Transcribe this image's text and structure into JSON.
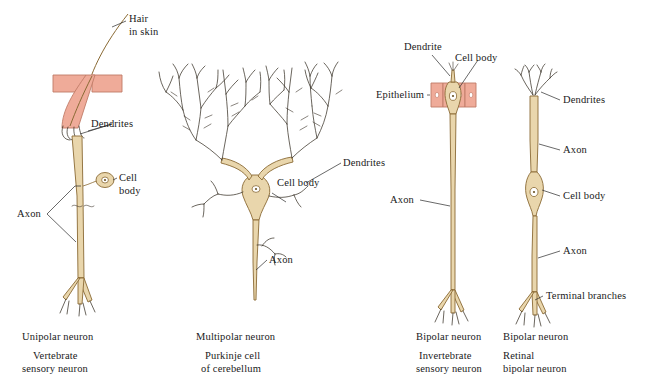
{
  "figure": {
    "background_color": "#ffffff",
    "ink_color": "#1a1a1a",
    "neuron_fill": "#e9d6ac",
    "neuron_outline": "#8a6a34",
    "skin_fill": "#efab99",
    "skin_outline": "#c07a67",
    "dendrite_line": "#3a3328"
  },
  "panels": [
    {
      "id": "unipolar",
      "name": "Vertebrate sensory neuron",
      "labels": [
        {
          "id": "hair-in-skin",
          "text": "Hair\nin skin"
        },
        {
          "id": "dendrites",
          "text": "Dendrites"
        },
        {
          "id": "cell-body",
          "text": "Cell\nbody"
        },
        {
          "id": "axon",
          "text": "Axon"
        }
      ],
      "caption_type": "Unipolar neuron",
      "caption_example_line1": "Vertebrate",
      "caption_example_line2": "sensory neuron"
    },
    {
      "id": "multipolar",
      "name": "Purkinje cell of cerebellum",
      "labels": [
        {
          "id": "dendrites",
          "text": "Dendrites"
        },
        {
          "id": "cell-body",
          "text": "Cell body"
        },
        {
          "id": "axon",
          "text": "Axon"
        }
      ],
      "caption_type": "Multipolar neuron",
      "caption_example_line1": "Purkinje cell",
      "caption_example_line2": "of cerebellum"
    },
    {
      "id": "bipolar-invertebrate",
      "name": "Invertebrate sensory neuron",
      "labels": [
        {
          "id": "dendrite",
          "text": "Dendrite"
        },
        {
          "id": "cell-body",
          "text": "Cell body"
        },
        {
          "id": "epithelium",
          "text": "Epithelium"
        },
        {
          "id": "axon",
          "text": "Axon"
        }
      ],
      "caption_type": "Bipolar neuron",
      "caption_example_line1": "Invertebrate",
      "caption_example_line2": "sensory neuron"
    },
    {
      "id": "bipolar-retinal",
      "name": "Retinal bipolar neuron",
      "labels": [
        {
          "id": "dendrites",
          "text": "Dendrites"
        },
        {
          "id": "axon-upper",
          "text": "Axon"
        },
        {
          "id": "cell-body",
          "text": "Cell body"
        },
        {
          "id": "axon-lower",
          "text": "Axon"
        },
        {
          "id": "terminal-branches",
          "text": "Terminal branches"
        }
      ],
      "caption_type": "Bipolar neuron",
      "caption_example_line1": "Retinal",
      "caption_example_line2": "bipolar neuron"
    }
  ],
  "label_text": {
    "hair_in_skin_l1": "Hair",
    "hair_in_skin_l2": "in skin",
    "dendrites": "Dendrites",
    "dendrite": "Dendrite",
    "cell_body": "Cell body",
    "cell_l1": "Cell",
    "cell_l2": "body",
    "axon": "Axon",
    "epithelium": "Epithelium",
    "terminal_branches": "Terminal branches"
  },
  "captions": {
    "unipolar_type": "Unipolar neuron",
    "unipolar_ex1": "Vertebrate",
    "unipolar_ex2": "sensory neuron",
    "multipolar_type": "Multipolar neuron",
    "multipolar_ex1": "Purkinje cell",
    "multipolar_ex2": "of cerebellum",
    "bipolar_inv_type": "Bipolar neuron",
    "bipolar_inv_ex1": "Invertebrate",
    "bipolar_inv_ex2": "sensory neuron",
    "bipolar_ret_type": "Bipolar neuron",
    "bipolar_ret_ex1": "Retinal",
    "bipolar_ret_ex2": "bipolar neuron"
  }
}
